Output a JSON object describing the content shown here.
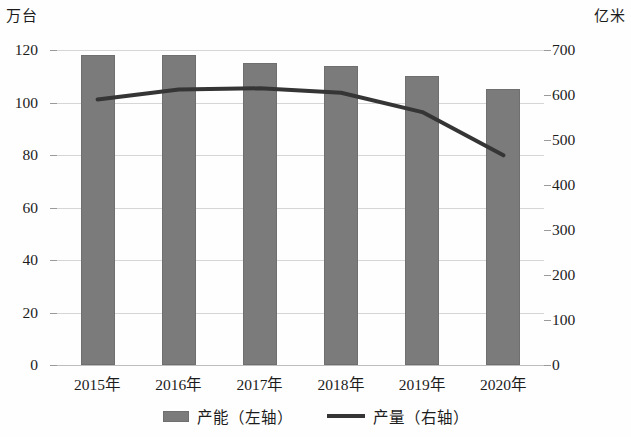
{
  "chart_data": {
    "type": "bar",
    "title": "",
    "subtitle": "",
    "xlabel": "",
    "categories": [
      "2015年",
      "2016年",
      "2017年",
      "2018年",
      "2019年",
      "2020年"
    ],
    "grid": true,
    "legend_position": "bottom",
    "axes": {
      "left": {
        "unit": "万台",
        "label": "万台",
        "ylim": [
          0,
          120
        ],
        "ticks": [
          0,
          20,
          40,
          60,
          80,
          100,
          120
        ],
        "tick_labels": [
          "0",
          "20",
          "40",
          "60",
          "80",
          "100",
          "120"
        ]
      },
      "right": {
        "unit": "亿米",
        "label": "亿米",
        "ylim": [
          0,
          700
        ],
        "ticks": [
          0,
          100,
          200,
          300,
          400,
          500,
          600,
          700
        ],
        "tick_labels": [
          "0",
          "100",
          "200",
          "300",
          "400",
          "500",
          "600",
          "700"
        ]
      }
    },
    "series": [
      {
        "name": "产能（左轴）",
        "type": "bar",
        "axis": "left",
        "color": "#7b7b7b",
        "values": [
          118,
          118,
          115,
          114,
          110,
          105
        ]
      },
      {
        "name": "产量（右轴）",
        "type": "line",
        "axis": "right",
        "color": "#353535",
        "values": [
          590,
          612,
          615,
          605,
          562,
          466
        ]
      }
    ]
  },
  "legend": {
    "items": [
      {
        "label": "产能（左轴）",
        "marker": "bar-swatch"
      },
      {
        "label": "产量（右轴）",
        "marker": "line-swatch"
      }
    ]
  }
}
